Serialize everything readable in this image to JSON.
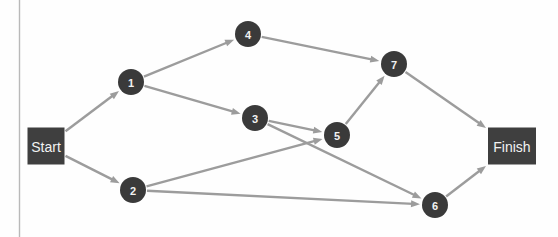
{
  "diagram": {
    "type": "directed-graph",
    "title": "",
    "background_color": "#fefefe",
    "edge_color": "#9c9c9c",
    "node_color": "#3a3a3a",
    "terminal_color": "#3f3f3f",
    "label_color": "#f2f2f2",
    "border_line_color": "#b9b9b9",
    "nodes": [
      {
        "id": "start",
        "label": "Start",
        "shape": "rect",
        "x": 46,
        "y": 146,
        "w": 37,
        "h": 37
      },
      {
        "id": "n1",
        "label": "1",
        "shape": "circle",
        "x": 131,
        "y": 82,
        "r": 13
      },
      {
        "id": "n2",
        "label": "2",
        "shape": "circle",
        "x": 133,
        "y": 190,
        "r": 13
      },
      {
        "id": "n3",
        "label": "3",
        "shape": "circle",
        "x": 255,
        "y": 118,
        "r": 13
      },
      {
        "id": "n4",
        "label": "4",
        "shape": "circle",
        "x": 248,
        "y": 34,
        "r": 13
      },
      {
        "id": "n5",
        "label": "5",
        "shape": "circle",
        "x": 337,
        "y": 135,
        "r": 13
      },
      {
        "id": "n6",
        "label": "6",
        "shape": "circle",
        "x": 435,
        "y": 205,
        "r": 13
      },
      {
        "id": "n7",
        "label": "7",
        "shape": "circle",
        "x": 394,
        "y": 64,
        "r": 13
      },
      {
        "id": "finish",
        "label": "Finish",
        "shape": "rect",
        "x": 512,
        "y": 146,
        "w": 48,
        "h": 37
      }
    ],
    "edges": [
      {
        "from": "start",
        "to": "n1"
      },
      {
        "from": "start",
        "to": "n2"
      },
      {
        "from": "n1",
        "to": "n4"
      },
      {
        "from": "n1",
        "to": "n3"
      },
      {
        "from": "n4",
        "to": "n7"
      },
      {
        "from": "n3",
        "to": "n5"
      },
      {
        "from": "n3",
        "to": "n6"
      },
      {
        "from": "n2",
        "to": "n5"
      },
      {
        "from": "n2",
        "to": "n6"
      },
      {
        "from": "n5",
        "to": "n7"
      },
      {
        "from": "n7",
        "to": "finish"
      },
      {
        "from": "n6",
        "to": "finish"
      }
    ]
  }
}
